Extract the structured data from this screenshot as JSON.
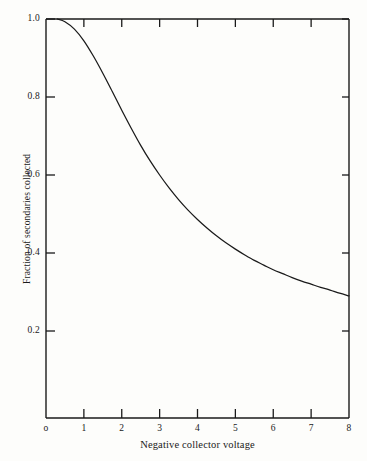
{
  "chart_data": {
    "type": "line",
    "title": "",
    "subtitle": "",
    "xlabel": "Negative collector voltage",
    "ylabel": "Fraction of secondaries collected",
    "xlim": [
      0,
      8
    ],
    "ylim": [
      0,
      1.0
    ],
    "grid": false,
    "legend": "none",
    "x_tick_labels": [
      "o",
      "1",
      "2",
      "3",
      "4",
      "5",
      "6",
      "7",
      "8"
    ],
    "x_tick_values": [
      0,
      1,
      2,
      3,
      4,
      5,
      6,
      7,
      8
    ],
    "y_tick_labels": [
      "0.2",
      "0.4",
      "0.6",
      "0.8",
      "1.0"
    ],
    "y_tick_values": [
      0.2,
      0.4,
      0.6,
      0.8,
      1.0
    ],
    "series": [
      {
        "name": "Fraction of secondaries collected",
        "x": [
          0.3,
          0.5,
          0.75,
          1.0,
          1.25,
          1.5,
          1.75,
          2.0,
          2.25,
          2.5,
          2.75,
          3.0,
          3.25,
          3.5,
          3.75,
          4.0,
          4.25,
          4.5,
          4.75,
          5.0,
          5.25,
          5.5,
          5.75,
          6.0,
          6.25,
          6.5,
          6.75,
          7.0,
          7.25,
          7.5,
          7.75,
          8.0
        ],
        "y": [
          1.0,
          0.993,
          0.974,
          0.944,
          0.905,
          0.861,
          0.814,
          0.766,
          0.72,
          0.676,
          0.636,
          0.6,
          0.567,
          0.537,
          0.51,
          0.486,
          0.464,
          0.444,
          0.426,
          0.41,
          0.395,
          0.381,
          0.369,
          0.357,
          0.347,
          0.337,
          0.328,
          0.32,
          0.312,
          0.305,
          0.297,
          0.29
        ]
      }
    ],
    "colors": {
      "line": "#1a1a1a",
      "axis": "#1a1a1a",
      "background": "#fdfdfb"
    }
  },
  "axes": {
    "y_labels": [
      {
        "text": "1.0",
        "value": 1.0
      },
      {
        "text": "0.8",
        "value": 0.8
      },
      {
        "text": "0.6",
        "value": 0.6
      },
      {
        "text": "0.4",
        "value": 0.4
      },
      {
        "text": "0.2",
        "value": 0.2
      }
    ],
    "x_labels": [
      {
        "text": "o",
        "value": 0
      },
      {
        "text": "1",
        "value": 1
      },
      {
        "text": "2",
        "value": 2
      },
      {
        "text": "3",
        "value": 3
      },
      {
        "text": "4",
        "value": 4
      },
      {
        "text": "5",
        "value": 5
      },
      {
        "text": "6",
        "value": 6
      },
      {
        "text": "7",
        "value": 7
      },
      {
        "text": "8",
        "value": 8
      }
    ],
    "y_title": "Fraction of secondaries collected",
    "x_title": "Negative collector voltage"
  }
}
